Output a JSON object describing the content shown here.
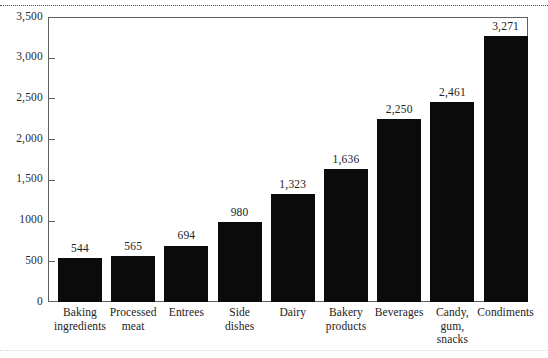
{
  "chart_data": {
    "type": "bar",
    "title": "",
    "subtitle": "",
    "xlabel": "",
    "ylabel": "",
    "ylim": [
      0,
      3500
    ],
    "grid": false,
    "legend": false,
    "orientation": "vertical",
    "bar_color": "#0b0b0b",
    "frame_color": "#5f5f5f",
    "categories": [
      "Baking ingredients",
      "Processed meat",
      "Entrees",
      "Side dishes",
      "Dairy",
      "Bakery products",
      "Beverages",
      "Candy, gum, snacks",
      "Condiments"
    ],
    "category_lines": [
      [
        "Baking",
        "ingredients"
      ],
      [
        "Processed",
        "meat"
      ],
      [
        "Entrees"
      ],
      [
        "Side",
        "dishes"
      ],
      [
        "Dairy"
      ],
      [
        "Bakery",
        "products"
      ],
      [
        "Beverages"
      ],
      [
        "Candy,",
        "gum,",
        "snacks"
      ],
      [
        "Condiments"
      ]
    ],
    "values": [
      544,
      565,
      694,
      980,
      1323,
      1636,
      2250,
      2461,
      3271
    ],
    "value_labels": [
      "544",
      "565",
      "694",
      "980",
      "1,323",
      "1,636",
      "2,250",
      "2,461",
      "3,271"
    ],
    "yticks": [
      0,
      500,
      1000,
      1500,
      2000,
      2500,
      3000,
      3500
    ],
    "ytick_labels": [
      "0",
      "500",
      "1000",
      "1,500",
      "2,000",
      "2,500",
      "3,000",
      "3,500"
    ]
  }
}
